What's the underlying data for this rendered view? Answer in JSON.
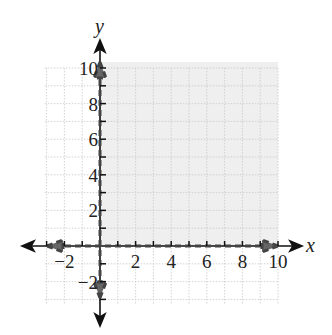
{
  "header_fragment": "graph",
  "chart_data": {
    "type": "region",
    "title": "",
    "xlabel": "x",
    "ylabel": "y",
    "xlim": [
      -3,
      10
    ],
    "ylim": [
      -3,
      10
    ],
    "grid": true,
    "x_ticks": [
      -2,
      2,
      4,
      6,
      8,
      10
    ],
    "y_ticks": [
      -2,
      2,
      4,
      6,
      8,
      10
    ],
    "x_tick_labels": [
      "−2",
      "2",
      "4",
      "6",
      "8",
      "10"
    ],
    "y_tick_labels": [
      "−2",
      "2",
      "4",
      "6",
      "8",
      "10"
    ],
    "boundaries": [
      {
        "name": "x = 0",
        "style": "dashed",
        "from": [
          0,
          -3
        ],
        "to": [
          0,
          10
        ]
      },
      {
        "name": "y = 0",
        "style": "dashed",
        "from": [
          -2,
          0
        ],
        "to": [
          10,
          0
        ]
      }
    ],
    "shaded_region": {
      "description": "x > 0 and y > 0 (first quadrant)",
      "x": [
        0,
        10
      ],
      "y": [
        0,
        10
      ]
    },
    "colors": {
      "shade": "#efefef",
      "grid": "#c8c8c8",
      "axis": "#111111",
      "boundary": "#555555"
    }
  }
}
